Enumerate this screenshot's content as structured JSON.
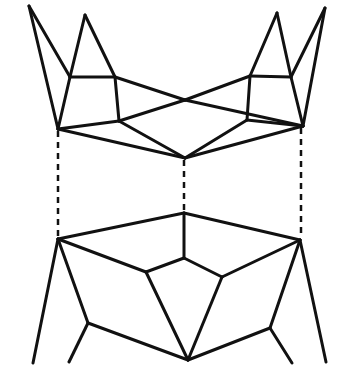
{
  "figure": {
    "stroke_color": "#111111",
    "background_color": "#ffffff",
    "upper_piece": {
      "stroke_width": 3,
      "edges": [
        [
          29,
          6,
          58,
          129
        ],
        [
          29,
          6,
          70,
          77
        ],
        [
          85,
          15,
          70,
          77
        ],
        [
          85,
          15,
          115,
          77
        ],
        [
          70,
          77,
          115,
          77
        ],
        [
          70,
          77,
          58,
          129
        ],
        [
          115,
          77,
          119,
          121
        ],
        [
          58,
          129,
          119,
          121
        ],
        [
          115,
          77,
          185,
          100
        ],
        [
          185,
          100,
          303,
          126
        ],
        [
          119,
          121,
          185,
          100
        ],
        [
          185,
          100,
          250,
          76
        ],
        [
          58,
          129,
          185,
          158
        ],
        [
          119,
          121,
          185,
          158
        ],
        [
          185,
          158,
          247,
          120
        ],
        [
          185,
          158,
          303,
          126
        ],
        [
          250,
          76,
          291,
          77
        ],
        [
          250,
          76,
          247,
          120
        ],
        [
          247,
          120,
          303,
          126
        ],
        [
          250,
          76,
          277,
          13
        ],
        [
          277,
          13,
          291,
          77
        ],
        [
          291,
          77,
          325,
          8
        ],
        [
          291,
          77,
          303,
          126
        ],
        [
          325,
          8,
          303,
          126
        ]
      ]
    },
    "lower_piece": {
      "stroke_width": 3,
      "edges": [
        [
          58,
          239,
          184,
          213
        ],
        [
          184,
          213,
          300,
          240
        ],
        [
          184,
          213,
          184,
          258
        ],
        [
          58,
          239,
          146,
          272
        ],
        [
          146,
          272,
          184,
          258
        ],
        [
          184,
          258,
          222,
          277
        ],
        [
          222,
          277,
          300,
          240
        ],
        [
          146,
          272,
          188,
          360
        ],
        [
          222,
          277,
          188,
          360
        ],
        [
          58,
          239,
          33,
          363
        ],
        [
          58,
          239,
          88,
          323
        ],
        [
          88,
          323,
          69,
          362
        ],
        [
          88,
          323,
          188,
          360
        ],
        [
          188,
          360,
          270,
          328
        ],
        [
          270,
          328,
          300,
          240
        ],
        [
          270,
          328,
          292,
          363
        ],
        [
          300,
          240,
          326,
          362
        ]
      ]
    },
    "guides": {
      "stroke_width": 2.5,
      "dash": "6,5",
      "lines": [
        [
          58,
          131,
          58,
          237
        ],
        [
          184,
          160,
          184,
          211
        ],
        [
          301,
          128,
          301,
          238
        ]
      ]
    }
  }
}
